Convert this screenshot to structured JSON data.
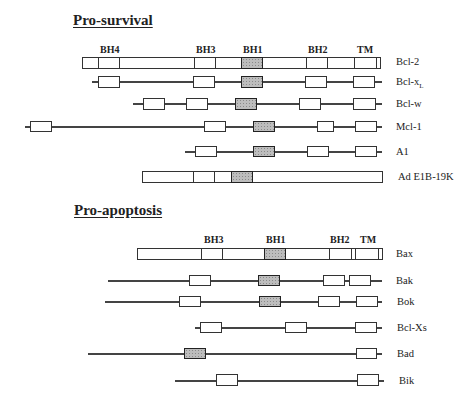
{
  "sections": {
    "pro_survival": "Pro-survival",
    "pro_apoptosis": "Pro-apoptosis"
  },
  "domain_headers_survival": [
    {
      "label": "BH4",
      "x": 99
    },
    {
      "label": "BH3",
      "x": 195
    },
    {
      "label": "BH1",
      "x": 243
    },
    {
      "label": "BH2",
      "x": 307
    },
    {
      "label": "TM",
      "x": 356
    }
  ],
  "domain_headers_apoptosis": [
    {
      "label": "BH3",
      "x": 203
    },
    {
      "label": "BH1",
      "x": 265
    },
    {
      "label": "BH2",
      "x": 329
    },
    {
      "label": "TM",
      "x": 358
    }
  ],
  "proteins": {
    "bcl2": "Bcl-2",
    "bclxl_main": "Bcl-x",
    "bclxl_sub": "L",
    "bclw": "Bcl-w",
    "mcl1": "Mcl-1",
    "a1": "A1",
    "ade1b": "Ad E1B-19K",
    "bax": "Bax",
    "bak": "Bak",
    "bok": "Bok",
    "bclxs": "Bcl-Xs",
    "bad": "Bad",
    "bik": "Bik"
  }
}
